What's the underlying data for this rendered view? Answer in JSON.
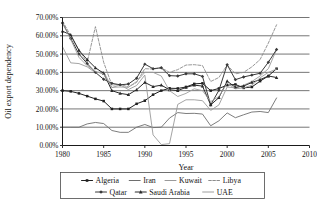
{
  "chart_data": {
    "type": "line",
    "title": "",
    "xlabel": "Year",
    "ylabel": "Oil export dependency",
    "xlim": [
      1980,
      2010
    ],
    "ylim": [
      0,
      0.7
    ],
    "xticks": [
      1980,
      1985,
      1990,
      1995,
      2000,
      2005,
      2010
    ],
    "xtick_labels": [
      "1980",
      "1985",
      "1990",
      "1995",
      "2000",
      "2005",
      "2010"
    ],
    "yticks": [
      0,
      0.1,
      0.2,
      0.3,
      0.4,
      0.5,
      0.6,
      0.7
    ],
    "ytick_labels": [
      "0.00%",
      "10.00%",
      "20.00%",
      "30.00%",
      "40.00%",
      "50.00%",
      "60.00%",
      "70.00%"
    ],
    "grid": "horizontal",
    "legend_position": "bottom",
    "x": [
      1980,
      1981,
      1982,
      1983,
      1984,
      1985,
      1986,
      1987,
      1988,
      1989,
      1990,
      1991,
      1992,
      1993,
      1994,
      1995,
      1996,
      1997,
      1998,
      1999,
      2000,
      2001,
      2002,
      2003,
      2004,
      2005,
      2006
    ],
    "series": [
      {
        "name": "Algeria",
        "color": "#202020",
        "marker": "square",
        "dash": "none",
        "width": 1.0,
        "values": [
          0.3,
          0.296,
          0.285,
          0.27,
          0.255,
          0.243,
          0.2,
          0.2,
          0.2,
          0.228,
          0.245,
          0.278,
          0.3,
          0.313,
          0.312,
          0.32,
          0.337,
          0.34,
          0.3,
          0.312,
          0.33,
          0.334,
          0.315,
          0.32,
          0.352,
          0.38,
          0.42
        ]
      },
      {
        "name": "Iran",
        "color": "#6e6e6e",
        "marker": "none",
        "dash": "none",
        "width": 0.9,
        "values": [
          0.1,
          0.1,
          0.1,
          0.118,
          0.126,
          0.12,
          0.082,
          0.072,
          0.072,
          0.1,
          0.115,
          0.098,
          0.1,
          0.15,
          0.18,
          0.175,
          0.176,
          0.172,
          0.108,
          0.135,
          0.178,
          0.152,
          0.168,
          0.183,
          0.186,
          0.18,
          0.26
        ]
      },
      {
        "name": "Kuwait",
        "color": "#9a9a9a",
        "marker": "none",
        "dash": "none",
        "width": 0.9,
        "values": [
          0.54,
          0.452,
          0.448,
          0.43,
          0.398,
          0.404,
          0.316,
          0.332,
          0.306,
          0.328,
          0.385,
          0.058,
          0.005,
          0.01,
          0.225,
          0.25,
          0.25,
          0.245,
          0.192,
          0.222,
          0.32,
          0.315,
          0.33,
          0.35,
          0.38,
          0.42,
          0.525
        ]
      },
      {
        "name": "Libya",
        "color": "#8c8c8c",
        "marker": "none",
        "dash": "dash",
        "width": 0.9,
        "values": [
          0.68,
          0.6,
          0.52,
          0.455,
          0.65,
          0.455,
          0.33,
          0.335,
          0.32,
          0.345,
          0.42,
          0.418,
          0.425,
          0.4,
          0.415,
          0.44,
          0.442,
          0.437,
          0.35,
          0.372,
          0.44,
          0.392,
          0.4,
          0.43,
          0.47,
          0.56,
          0.66
        ]
      },
      {
        "name": "Qatar",
        "color": "#3a3a3a",
        "marker": "diamond",
        "dash": "none",
        "width": 1.0,
        "values": [
          0.67,
          0.585,
          0.5,
          0.448,
          0.4,
          0.362,
          0.34,
          0.332,
          0.336,
          0.368,
          0.445,
          0.42,
          0.425,
          0.382,
          0.38,
          0.392,
          0.392,
          0.378,
          0.222,
          0.302,
          0.442,
          0.36,
          0.375,
          0.385,
          0.395,
          0.455,
          0.525
        ]
      },
      {
        "name": "Saudi Arabia",
        "color": "#2a2a2a",
        "marker": "triangle",
        "dash": "none",
        "width": 1.0,
        "values": [
          0.625,
          0.605,
          0.52,
          0.47,
          0.425,
          0.395,
          0.3,
          0.285,
          0.278,
          0.305,
          0.345,
          0.322,
          0.33,
          0.305,
          0.3,
          0.318,
          0.33,
          0.325,
          0.222,
          0.262,
          0.352,
          0.318,
          0.325,
          0.345,
          0.36,
          0.38,
          0.372
        ]
      },
      {
        "name": "UAE",
        "color": "#9e9e9e",
        "marker": "none",
        "dash": "none",
        "width": 0.9,
        "values": [
          0.67,
          0.58,
          0.482,
          0.436,
          0.405,
          0.39,
          0.318,
          0.32,
          0.318,
          0.35,
          0.4,
          0.4,
          0.38,
          0.3,
          0.268,
          0.285,
          0.31,
          0.3,
          0.24,
          0.268,
          0.34,
          0.31,
          0.315,
          0.33,
          0.37,
          0.4,
          0.418
        ]
      }
    ]
  },
  "legend": {
    "row1": [
      "Algeria",
      "Iran",
      "Kuwait",
      "Libya"
    ],
    "row2": [
      "Qatar",
      "Saudi Arabia",
      "UAE"
    ]
  }
}
